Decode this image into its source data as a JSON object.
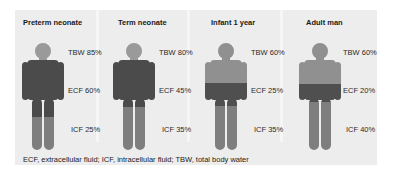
{
  "figure": {
    "panels": [
      {
        "title": "Preterm neonate",
        "tbw": "TBW 85%",
        "ecf": "ECF 60%",
        "icf": "ICF 25%",
        "head_color": "#9a9a9a",
        "upper_color": "#4b4b4b",
        "band_color": "#4b4b4b",
        "lower_color": "#7e7e7e",
        "band_top": 17,
        "band_bottom": 74
      },
      {
        "title": "Term neonate",
        "tbw": "TBW 80%",
        "ecf": "ECF 45%",
        "icf": "ICF 35%",
        "head_color": "#9a9a9a",
        "upper_color": "#4b4b4b",
        "band_color": "#4b4b4b",
        "lower_color": "#7e7e7e",
        "band_top": 17,
        "band_bottom": 64
      },
      {
        "title": "Infant 1 year",
        "tbw": "TBW 60%",
        "ecf": "ECF 25%",
        "icf": "ICF 35%",
        "head_color": "#909090",
        "upper_color": "#909090",
        "band_color": "#4f4f4f",
        "lower_color": "#7e7e7e",
        "band_top": 40,
        "band_bottom": 63
      },
      {
        "title": "Adult man",
        "tbw": "TBW 60%",
        "ecf": "ECF 20%",
        "icf": "ICF 40%",
        "head_color": "#909090",
        "upper_color": "#909090",
        "band_color": "#4f4f4f",
        "lower_color": "#7e7e7e",
        "band_top": 41,
        "band_bottom": 59
      }
    ],
    "caption": "ECF, extracellular fluid; ICF, intracellular fluid; TBW, total body water"
  }
}
